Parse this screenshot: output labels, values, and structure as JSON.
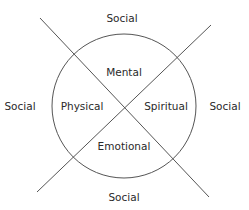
{
  "diagram": {
    "inner_labels": {
      "top": "Mental",
      "left": "Physical",
      "right": "Spiritual",
      "bottom": "Emotional"
    },
    "outer_labels": {
      "top": "Social",
      "left": "Social",
      "right": "Social",
      "bottom": "Social"
    },
    "colors": {
      "stroke": "#555555",
      "text": "#2a2a2a"
    }
  }
}
